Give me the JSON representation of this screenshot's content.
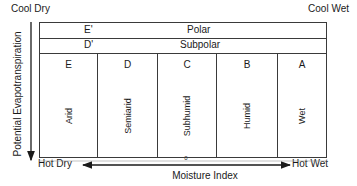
{
  "corners": {
    "top_left": "Cool Dry",
    "top_right": "Cool Wet",
    "bottom_left": "Hot Dry",
    "bottom_right": "Hot Wet"
  },
  "rows": [
    {
      "code": "E'",
      "name": "Polar"
    },
    {
      "code": "D'",
      "name": "Subpolar"
    }
  ],
  "columns": [
    {
      "code": "E",
      "name": "Arid"
    },
    {
      "code": "D",
      "name": "Semiarid"
    },
    {
      "code": "C",
      "name": "Subhumid"
    },
    {
      "code": "B",
      "name": "Humid"
    },
    {
      "code": "A",
      "name": "Wet"
    }
  ],
  "axes": {
    "y_label": "Potential Evapotranspiration",
    "x_label": "Moisture Index",
    "x_zero": "0"
  }
}
